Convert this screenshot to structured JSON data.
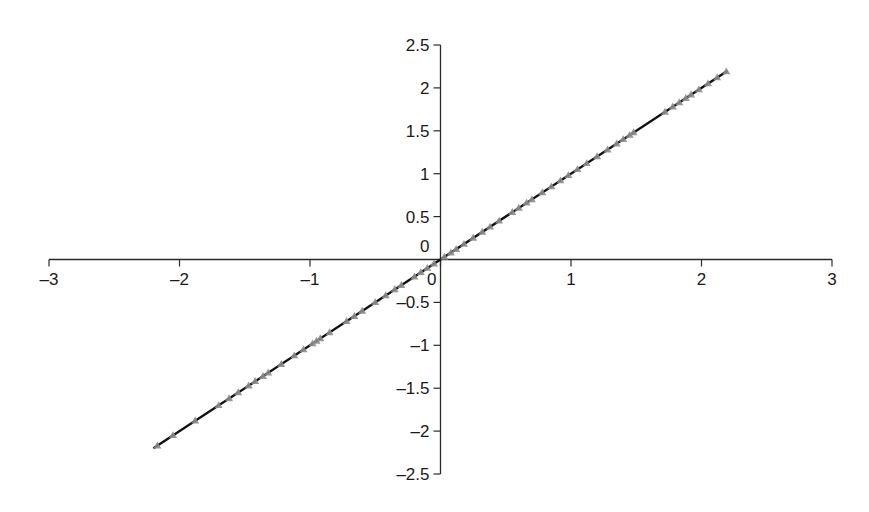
{
  "chart_data": {
    "type": "line",
    "title": "",
    "xlabel": "",
    "ylabel": "",
    "xlim": [
      -3,
      3
    ],
    "ylim": [
      -2.5,
      2.5
    ],
    "grid": false,
    "legend": null,
    "axes_cross_at_origin": true,
    "x_ticks": [
      -3,
      -2,
      -1,
      0,
      1,
      2,
      3
    ],
    "x_tick_labels": [
      "–3",
      "–2",
      "–1",
      "0",
      "1",
      "2",
      "3"
    ],
    "y_ticks": [
      2.5,
      2,
      1.5,
      1,
      0.5,
      0,
      -0.5,
      -1,
      -1.5,
      -2,
      -2.5
    ],
    "y_tick_labels": [
      "2.5",
      "2",
      "1.5",
      "1",
      "0.5",
      "0",
      "–0.5",
      "–1",
      "–1.5",
      "–2",
      "–2.5"
    ],
    "series": [
      {
        "name": "fit line",
        "style": "line",
        "color": "#111111",
        "x": [
          -2.2,
          2.2
        ],
        "y": [
          -2.2,
          2.2
        ]
      },
      {
        "name": "data points",
        "style": "triangle-markers",
        "color": "#8c8c8c",
        "x": [
          -2.17,
          -2.05,
          -1.88,
          -1.7,
          -1.62,
          -1.55,
          -1.47,
          -1.42,
          -1.36,
          -1.32,
          -1.22,
          -1.12,
          -1.05,
          -0.98,
          -0.95,
          -0.92,
          -0.85,
          -0.72,
          -0.66,
          -0.6,
          -0.5,
          -0.42,
          -0.35,
          -0.3,
          -0.2,
          -0.15,
          -0.1,
          -0.05,
          0.03,
          0.08,
          0.12,
          0.18,
          0.25,
          0.32,
          0.38,
          0.45,
          0.55,
          0.6,
          0.66,
          0.7,
          0.78,
          0.85,
          0.92,
          0.98,
          1.05,
          1.12,
          1.2,
          1.28,
          1.35,
          1.4,
          1.45,
          1.48,
          1.72,
          1.78,
          1.83,
          1.88,
          1.92,
          1.98,
          2.05,
          2.12,
          2.19
        ],
        "y": [
          -2.17,
          -2.05,
          -1.88,
          -1.7,
          -1.62,
          -1.55,
          -1.47,
          -1.42,
          -1.36,
          -1.32,
          -1.22,
          -1.12,
          -1.05,
          -0.98,
          -0.95,
          -0.92,
          -0.85,
          -0.72,
          -0.66,
          -0.6,
          -0.5,
          -0.42,
          -0.35,
          -0.3,
          -0.2,
          -0.15,
          -0.1,
          -0.05,
          0.03,
          0.08,
          0.12,
          0.18,
          0.25,
          0.32,
          0.38,
          0.45,
          0.55,
          0.6,
          0.66,
          0.7,
          0.78,
          0.85,
          0.92,
          0.98,
          1.05,
          1.12,
          1.2,
          1.28,
          1.35,
          1.4,
          1.45,
          1.48,
          1.72,
          1.78,
          1.83,
          1.88,
          1.92,
          1.98,
          2.05,
          2.12,
          2.19
        ]
      }
    ]
  },
  "colors": {
    "axis": "#2a2a2a",
    "line": "#111111",
    "marker": "#8c8c8c",
    "text": "#1a1a1a",
    "background": "#ffffff"
  }
}
